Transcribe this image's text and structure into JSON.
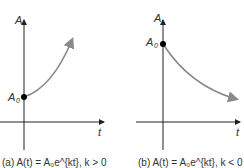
{
  "top_caption_partial": "",
  "graphs": [
    {
      "name": "growth",
      "y_axis_label": "A",
      "x_axis_label": "t",
      "intercept_label": "A",
      "intercept_subscript": "0",
      "caption": "(a) A(t) = A₀e^{kt}, k > 0",
      "curve_color": "#8a8a8a"
    },
    {
      "name": "decay",
      "y_axis_label": "A",
      "x_axis_label": "t",
      "intercept_label": "A",
      "intercept_subscript": "0",
      "caption": "(b) A(t) = A₀e^{kt}, k < 0",
      "curve_color": "#8a8a8a"
    }
  ],
  "colors": {
    "axis": "#222222",
    "curve": "#8a8a8a",
    "dot": "#000000"
  }
}
